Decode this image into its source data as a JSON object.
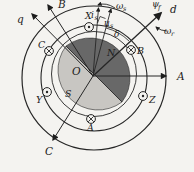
{
  "diagram": {
    "axis_labels": {
      "q": "q",
      "d": "d",
      "a": "A",
      "b": "B",
      "c": "C"
    },
    "center_label": "O",
    "pole_labels": {
      "north": "N",
      "south": "S"
    },
    "winding_labels": {
      "x": "X",
      "y": "Y",
      "z": "Z",
      "a": "A",
      "b": "B",
      "c": "C"
    },
    "vector_labels": {
      "current_main": "i",
      "current_sub": "s",
      "voltage_main": "u",
      "voltage_sub": "s",
      "load_angle": "δ",
      "flux_main": "ψ",
      "flux_sub": "f",
      "sync_speed_main": "ω",
      "sync_speed_sub": "s",
      "rotor_speed_main": "ω",
      "rotor_speed_sub": "r"
    },
    "colors": {
      "north_pole_fill": "#686868",
      "south_pole_fill": "#c8c6c2",
      "line": "#262626",
      "background": "#f4f3f0"
    }
  }
}
